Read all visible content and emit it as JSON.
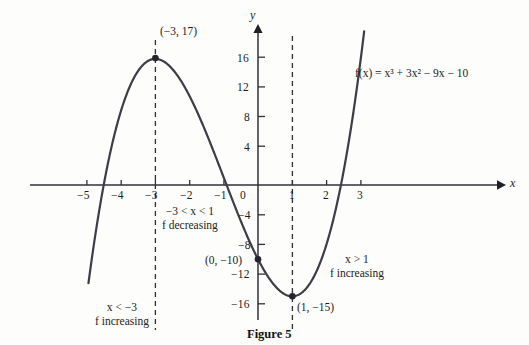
{
  "figure": {
    "caption": "Figure 5",
    "equation_label": "f(x) = x³ + 3x² − 9x − 10"
  },
  "axes": {
    "x_axis_label": "x",
    "y_axis_label": "y",
    "x_ticks": [
      {
        "value": -5,
        "label": "−5"
      },
      {
        "value": -4,
        "label": "−4"
      },
      {
        "value": -3,
        "label": "−3"
      },
      {
        "value": -2,
        "label": "−2"
      },
      {
        "value": -1,
        "label": "−1"
      },
      {
        "value": 0,
        "label": "0"
      },
      {
        "value": 1,
        "label": "1"
      },
      {
        "value": 2,
        "label": "2"
      },
      {
        "value": 3,
        "label": "3"
      }
    ],
    "y_ticks": [
      {
        "value": 16,
        "label": "16"
      },
      {
        "value": 12,
        "label": "12"
      },
      {
        "value": 8,
        "label": "8"
      },
      {
        "value": 4,
        "label": "4"
      },
      {
        "value": -4,
        "label": "−4"
      },
      {
        "value": -8,
        "label": "−8"
      },
      {
        "value": -12,
        "label": "−12"
      },
      {
        "value": -16,
        "label": "−16"
      }
    ]
  },
  "points": [
    {
      "name": "local-maximum",
      "label": "(−3, 17)",
      "x": -3,
      "y": 17
    },
    {
      "name": "y-intercept",
      "label": "(0, −10)",
      "x": 0,
      "y": -10
    },
    {
      "name": "local-minimum",
      "label": "(1, −15)",
      "x": 1,
      "y": -15
    }
  ],
  "annotations": [
    {
      "name": "left-interval",
      "line1": "x < −3",
      "line2": "f increasing"
    },
    {
      "name": "middle-interval",
      "line1": "−3 < x < 1",
      "line2": "f decreasing"
    },
    {
      "name": "right-interval",
      "line1": "x > 1",
      "line2": "f increasing"
    }
  ],
  "chart_data": {
    "type": "line",
    "title": "Figure 5",
    "xlabel": "x",
    "ylabel": "y",
    "xlim": [
      -5.6,
      3.6
    ],
    "ylim": [
      -18.5,
      19.5
    ],
    "grid": false,
    "legend": "none",
    "function": "f(x) = x^3 + 3x^2 - 9x - 10",
    "series": [
      {
        "name": "f(x) = x³ + 3x² − 9x − 10",
        "x": [
          -4.95,
          -4.75,
          -4.5,
          -4.25,
          -4,
          -3.75,
          -3.5,
          -3.25,
          -3,
          -2.75,
          -2.5,
          -2.25,
          -2,
          -1.75,
          -1.5,
          -1.25,
          -1,
          -0.75,
          -0.5,
          -0.25,
          0,
          0.25,
          0.5,
          0.75,
          1,
          1.25,
          1.5,
          1.75,
          2,
          2.25,
          2.5,
          2.75,
          3,
          3.1
        ],
        "y": [
          -13.12,
          -7.23,
          -2.38,
          1.83,
          5.0,
          7.45,
          9.38,
          11.0,
          11.0,
          11.89,
          11.88,
          11.2,
          10.0,
          9.58,
          7.88,
          5.73,
          3.0,
          -0.23,
          -2.5,
          -5.23,
          -10.0,
          -12.0,
          -13.6,
          -14.7,
          -15.0,
          -14.6,
          -13.4,
          -11.2,
          -8.0,
          -3.7,
          1.88,
          8.45,
          17.0,
          18.6
        ],
        "exact_values": {
          "note": "y = x^3 + 3x^2 - 9x - 10 evaluated on the plotted domain",
          "key_points": [
            {
              "x": -3,
              "y": 17
            },
            {
              "x": 0,
              "y": -10
            },
            {
              "x": 1,
              "y": -15
            }
          ]
        }
      }
    ],
    "vertical_dashed_lines": [
      -3,
      1
    ],
    "annotations": [
      {
        "text": "x < −3 / f increasing",
        "at_x": -3.9,
        "at_y": -15
      },
      {
        "text": "−3 < x < 1 / f decreasing",
        "at_x": -1.5,
        "at_y": -5
      },
      {
        "text": "x > 1 / f increasing",
        "at_x": 2.0,
        "at_y": -10
      },
      {
        "text": "f(x) = x³ + 3x² − 9x − 10",
        "at_x": 3.2,
        "at_y": 14
      }
    ]
  },
  "colors": {
    "curve": "#3d3d46",
    "axis": "#30303a",
    "dashed": "#2e2e38",
    "text": "#1c1c1c",
    "background": "#fdfdfc"
  }
}
